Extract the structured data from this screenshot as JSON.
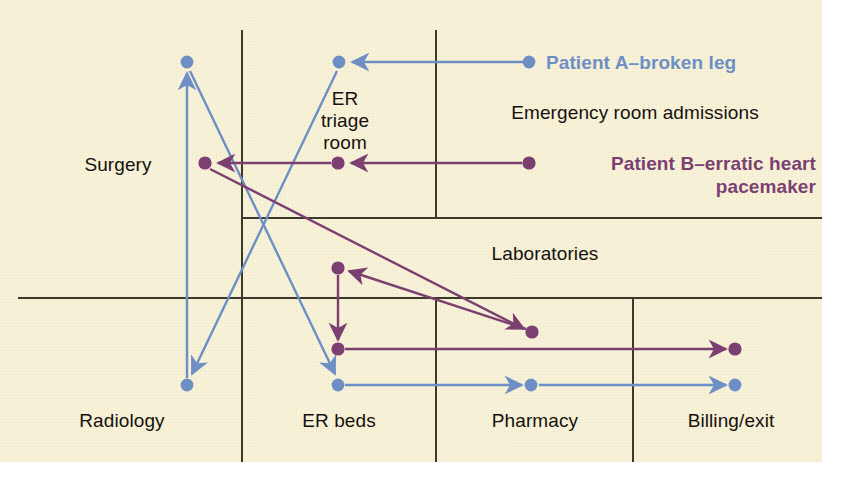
{
  "diagram": {
    "background_color": "#f7f2d8",
    "gridline_color": "#3a3a28",
    "zones": [
      {
        "key": "surgery",
        "label": "Surgery"
      },
      {
        "key": "er_triage",
        "label": "ER\ntriage\nroom"
      },
      {
        "key": "er_admit",
        "label": "Emergency room admissions"
      },
      {
        "key": "labs",
        "label": "Laboratories"
      },
      {
        "key": "radiology",
        "label": "Radiology"
      },
      {
        "key": "er_beds",
        "label": "ER beds"
      },
      {
        "key": "pharmacy",
        "label": "Pharmacy"
      },
      {
        "key": "billing",
        "label": "Billing/exit"
      }
    ],
    "legend": [
      {
        "key": "patient_a",
        "label": "Patient A–broken leg",
        "color": "#6d8fc6",
        "align": "left"
      },
      {
        "key": "patient_b",
        "label": "Patient B–erratic heart\npacemaker",
        "color": "#7c3f72",
        "align": "right"
      }
    ],
    "paths": [
      {
        "patient": "Patient A–broken leg",
        "color": "#6d8fc6",
        "stops": [
          "Emergency room admissions",
          "ER triage room",
          "ER beds",
          "Surgery",
          "Radiology",
          "ER beds",
          "Pharmacy",
          "Billing/exit"
        ]
      },
      {
        "patient": "Patient B–erratic heart pacemaker",
        "color": "#7c3f72",
        "stops": [
          "Emergency room admissions",
          "ER triage room",
          "Surgery",
          "Laboratories",
          "ER beds",
          "Billing/exit"
        ]
      }
    ]
  }
}
